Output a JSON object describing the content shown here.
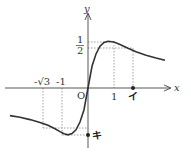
{
  "diagram": {
    "function": "y = x/(x^2+1)",
    "axes": {
      "x_label": "x",
      "y_label": "y",
      "origin_label": "O"
    },
    "x_ticks": [
      {
        "label": "-√3",
        "value": -1.732
      },
      {
        "label": "-1",
        "value": -1
      },
      {
        "label": "1",
        "value": 1
      }
    ],
    "y_ticks": [
      {
        "numerator": "1",
        "denominator": "2",
        "value": 0.5
      }
    ],
    "markers": [
      {
        "label": "イ",
        "axis": "x",
        "value": 1.732
      },
      {
        "label": "キ",
        "axis": "y",
        "value": -0.5
      }
    ],
    "colors": {
      "curve": "#333333",
      "axis": "#444444",
      "guide": "#777777"
    }
  }
}
